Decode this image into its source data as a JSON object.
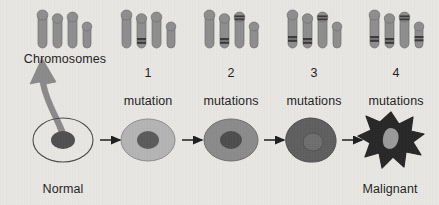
{
  "figure": {
    "background_color": "#e8e7e3",
    "text_color": "#1d1d1d"
  },
  "chromosome_row": {
    "groups": [
      {
        "id": "group-chromosomes",
        "label_line1": "Chromosomes",
        "label_line2": "",
        "mutation_count": 0,
        "center_x": 64,
        "chromosomes": [
          {
            "index": 1,
            "height": 36,
            "width": 9,
            "bands": []
          },
          {
            "index": 2,
            "height": 32,
            "width": 9,
            "bands": []
          },
          {
            "index": 3,
            "height": 34,
            "width": 9,
            "bands": []
          },
          {
            "index": 4,
            "height": 24,
            "width": 8,
            "bands": []
          }
        ]
      },
      {
        "id": "group-1-mutation",
        "label_line1": "1",
        "label_line2": "mutation",
        "mutation_count": 1,
        "center_x": 148,
        "chromosomes": [
          {
            "index": 1,
            "height": 36,
            "width": 9,
            "bands": []
          },
          {
            "index": 2,
            "height": 32,
            "width": 9,
            "bands": [
              0.72
            ]
          },
          {
            "index": 3,
            "height": 34,
            "width": 9,
            "bands": []
          },
          {
            "index": 4,
            "height": 24,
            "width": 8,
            "bands": []
          }
        ]
      },
      {
        "id": "group-2-mutations",
        "label_line1": "2",
        "label_line2": "mutations",
        "mutation_count": 2,
        "center_x": 231,
        "chromosomes": [
          {
            "index": 1,
            "height": 36,
            "width": 9,
            "bands": []
          },
          {
            "index": 2,
            "height": 32,
            "width": 9,
            "bands": [
              0.72
            ]
          },
          {
            "index": 3,
            "height": 34,
            "width": 9,
            "bands": [
              0.12
            ]
          },
          {
            "index": 4,
            "height": 24,
            "width": 8,
            "bands": []
          }
        ]
      },
      {
        "id": "group-3-mutations",
        "label_line1": "3",
        "label_line2": "mutations",
        "mutation_count": 3,
        "center_x": 314,
        "chromosomes": [
          {
            "index": 1,
            "height": 36,
            "width": 9,
            "bands": [
              0.7
            ]
          },
          {
            "index": 2,
            "height": 32,
            "width": 9,
            "bands": [
              0.72
            ]
          },
          {
            "index": 3,
            "height": 34,
            "width": 9,
            "bands": [
              0.12
            ]
          },
          {
            "index": 4,
            "height": 24,
            "width": 8,
            "bands": []
          }
        ]
      },
      {
        "id": "group-4-mutations",
        "label_line1": "4",
        "label_line2": "mutations",
        "mutation_count": 4,
        "center_x": 396,
        "chromosomes": [
          {
            "index": 1,
            "height": 36,
            "width": 9,
            "bands": [
              0.7
            ]
          },
          {
            "index": 2,
            "height": 32,
            "width": 9,
            "bands": [
              0.72
            ]
          },
          {
            "index": 3,
            "height": 34,
            "width": 9,
            "bands": [
              0.12
            ]
          },
          {
            "index": 4,
            "height": 24,
            "width": 8,
            "bands": [
              0.58
            ]
          }
        ]
      }
    ],
    "chromosome_fill": "#8e8e8e",
    "chromosome_stroke": "#6f6f6f",
    "band_color": "#3a3a3a"
  },
  "cell_row": {
    "cells": [
      {
        "id": "cell-normal",
        "stage": "normal",
        "label_line1": "Normal",
        "label_line2": "cell",
        "center_x": 63,
        "center_y": 140,
        "rx": 30,
        "ry": 22,
        "body_fill": "none",
        "body_stroke": "#4a4a4a",
        "nucleus_fill": "#4f4f4f",
        "nucleus_rx": 12,
        "nucleus_ry": 9,
        "shape": "ellipse"
      },
      {
        "id": "cell-stage-1",
        "stage": "1 mutation",
        "label_line1": "",
        "label_line2": "",
        "center_x": 148,
        "center_y": 140,
        "rx": 27,
        "ry": 21,
        "body_fill": "#b4b4b4",
        "body_stroke": "#8d8d8d",
        "nucleus_fill": "#5a5a5a",
        "nucleus_rx": 11,
        "nucleus_ry": 9,
        "shape": "ellipse"
      },
      {
        "id": "cell-stage-2",
        "stage": "2 mutations",
        "label_line1": "",
        "label_line2": "",
        "center_x": 231,
        "center_y": 140,
        "rx": 27,
        "ry": 21,
        "body_fill": "#8b8b8b",
        "body_stroke": "#6e6e6e",
        "nucleus_fill": "#4d4d4d",
        "nucleus_rx": 11,
        "nucleus_ry": 9,
        "shape": "ellipse"
      },
      {
        "id": "cell-stage-3",
        "stage": "3 mutations",
        "label_line1": "",
        "label_line2": "",
        "center_x": 310,
        "center_y": 140,
        "rx": 25,
        "ry": 22,
        "body_fill": "#5e5e5e",
        "body_stroke": "#4e4e4e",
        "nucleus_fill": "#6d6d6d",
        "nucleus_rx": 10,
        "nucleus_ry": 9,
        "shape": "irregular-blob"
      },
      {
        "id": "cell-malignant",
        "stage": "malignant",
        "label_line1": "Malignant",
        "label_line2": "cell",
        "center_x": 391,
        "center_y": 140,
        "rx": 30,
        "ry": 28,
        "body_fill": "#262626",
        "body_stroke": "#262626",
        "nucleus_fill": "#9a9a9a",
        "nucleus_rx": 9,
        "nucleus_ry": 10,
        "shape": "star-amoeboid"
      }
    ],
    "arrows": [
      {
        "id": "arrow-1",
        "from": "cell-normal",
        "to": "cell-stage-1",
        "x1": 100,
        "x2": 122,
        "y": 140
      },
      {
        "id": "arrow-2",
        "from": "cell-stage-1",
        "to": "cell-stage-2",
        "x1": 182,
        "x2": 204,
        "y": 140
      },
      {
        "id": "arrow-3",
        "from": "cell-stage-2",
        "to": "cell-stage-3",
        "x1": 264,
        "x2": 286,
        "y": 140
      },
      {
        "id": "arrow-4",
        "from": "cell-stage-3",
        "to": "cell-malignant",
        "x1": 342,
        "x2": 364,
        "y": 140
      }
    ],
    "arrow_color": "#1d1d1d"
  },
  "callout_arrow": {
    "id": "chromosomes-callout-arrow",
    "description": "thick curved arrow from the normal cell nucleus up to the Chromosomes label",
    "color": "#8a8a8a",
    "stroke": "#7b7b7b"
  }
}
